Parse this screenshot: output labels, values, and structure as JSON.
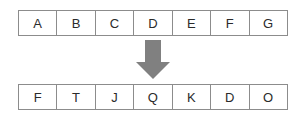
{
  "diagram": {
    "background_color": "#ffffff",
    "cell_border_color": "#8c8c8c",
    "cell_fill_color": "#ffffff",
    "text_color": "#2b2b2b",
    "arrow": {
      "icon": "arrow-down-icon",
      "direction": "down",
      "color": "#808080"
    },
    "top_row": {
      "name": "input-row",
      "cells": [
        "A",
        "B",
        "C",
        "D",
        "E",
        "F",
        "G"
      ]
    },
    "bottom_row": {
      "name": "output-row",
      "cells": [
        "F",
        "T",
        "J",
        "Q",
        "K",
        "D",
        "O"
      ]
    }
  }
}
